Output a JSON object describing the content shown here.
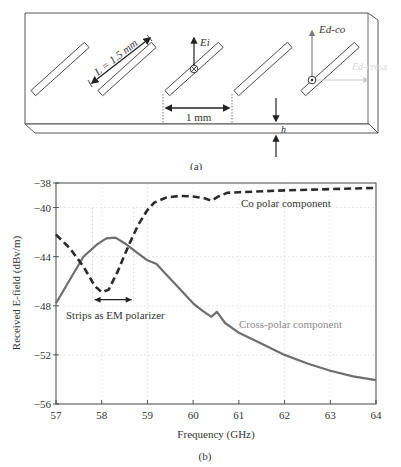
{
  "figure_a": {
    "caption": "(a)",
    "labels": {
      "length": "L = 1.5 mm",
      "spacing": "1 mm",
      "thickness": "h",
      "incident_field": "Ei",
      "co_field": "Ed-co",
      "cross_field": "Ed-cross"
    },
    "strip_count": 5
  },
  "figure_b": {
    "caption": "(b)",
    "annotations": {
      "co_label": "Co polar component",
      "cross_label": "Cross-polar component",
      "polarizer_label": "Strips as EM polarizer"
    }
  },
  "chart_data": {
    "type": "line",
    "title": "",
    "xlabel": "Frequency (GHz)",
    "ylabel": "Received E-field (dBv/m)",
    "xlim": [
      57,
      64
    ],
    "ylim": [
      -56,
      -38
    ],
    "xticks": [
      57,
      58,
      59,
      60,
      61,
      62,
      63,
      64
    ],
    "yticks": [
      -38,
      -40,
      -44,
      -48,
      -52,
      -56
    ],
    "ytick_labels": [
      "-38",
      "-40",
      "-44",
      "-48",
      "-52",
      "-56"
    ],
    "grid": true,
    "legend": "inline text annotations",
    "series": [
      {
        "name": "Co polar component",
        "style": "dashed",
        "color": "#2b2b2b",
        "x": [
          57,
          57.3,
          57.6,
          57.85,
          58.0,
          58.15,
          58.35,
          58.6,
          58.8,
          59.0,
          59.15,
          59.4,
          59.7,
          60.0,
          60.25,
          60.4,
          60.55,
          60.75,
          61,
          62,
          63,
          64
        ],
        "y": [
          -42.2,
          -43.3,
          -44.8,
          -46.4,
          -46.9,
          -46.7,
          -45.2,
          -43.0,
          -41.4,
          -40.2,
          -39.6,
          -39.2,
          -39.05,
          -39.1,
          -39.25,
          -39.45,
          -39.1,
          -38.8,
          -38.75,
          -38.6,
          -38.5,
          -38.4
        ]
      },
      {
        "name": "Cross-polar component",
        "style": "solid",
        "color": "#6e6e6e",
        "x": [
          57,
          57.3,
          57.6,
          57.9,
          58.1,
          58.3,
          58.5,
          58.75,
          59.0,
          59.2,
          59.35,
          59.7,
          60.0,
          60.2,
          60.4,
          60.52,
          60.7,
          61,
          61.5,
          62,
          62.5,
          63,
          63.5,
          64
        ],
        "y": [
          -47.8,
          -45.9,
          -44.0,
          -43.0,
          -42.5,
          -42.45,
          -42.9,
          -43.6,
          -44.3,
          -44.6,
          -45.2,
          -46.6,
          -47.8,
          -48.4,
          -48.9,
          -48.5,
          -49.4,
          -50.2,
          -51.1,
          -52.0,
          -52.7,
          -53.3,
          -53.75,
          -54.05
        ]
      }
    ],
    "annotation_range": {
      "label": "Strips as EM polarizer",
      "x_from": 57.8,
      "x_to": 58.7,
      "y": -47.5
    }
  }
}
